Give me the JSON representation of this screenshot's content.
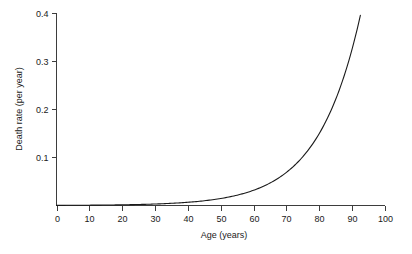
{
  "chart_data": {
    "type": "line",
    "title": "",
    "xlabel": "Age (years)",
    "ylabel": "Death rate (per year)",
    "xlim": [
      0,
      100
    ],
    "ylim": [
      0,
      0.4
    ],
    "grid": false,
    "legend": "none",
    "xticks": [
      "0",
      "10",
      "20",
      "30",
      "40",
      "50",
      "60",
      "70",
      "80",
      "90",
      "100"
    ],
    "xtick_values": [
      0,
      10,
      20,
      30,
      40,
      50,
      60,
      70,
      80,
      90,
      100
    ],
    "yticks": [
      "0.1",
      "0.2",
      "0.3",
      "0.4"
    ],
    "ytick_values": [
      0.1,
      0.2,
      0.3,
      0.4
    ],
    "series": [
      {
        "name": "Death rate",
        "color": "#1a1a1a",
        "x": [
          0,
          5,
          10,
          15,
          20,
          25,
          30,
          35,
          40,
          45,
          50,
          55,
          60,
          65,
          70,
          75,
          80,
          85,
          90,
          95,
          100
        ],
        "values": [
          0.0003,
          0.00044,
          0.00065,
          0.00096,
          0.00142,
          0.00209,
          0.00308,
          0.00454,
          0.0067,
          0.00988,
          0.01457,
          0.02148,
          0.03167,
          0.0467,
          0.06886,
          0.10153,
          0.14969,
          0.22071,
          0.32545,
          0.47985,
          0.70753
        ]
      }
    ],
    "annotations": []
  },
  "axes": {
    "x_title": "Age (years)",
    "y_title": "Death rate (per year)"
  },
  "colors": {
    "curve": "#1a1a1a",
    "axis": "#3d3d3d",
    "background": "#ffffff",
    "text": "#1a1a1a"
  }
}
